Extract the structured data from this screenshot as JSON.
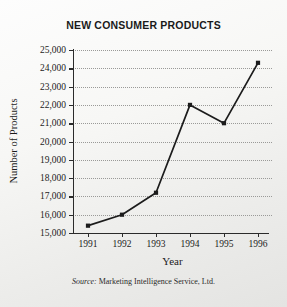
{
  "chart_data": {
    "type": "line",
    "title": "NEW CONSUMER PRODUCTS",
    "xlabel": "Year",
    "ylabel": "Number of Products",
    "categories": [
      "1991",
      "1992",
      "1993",
      "1994",
      "1995",
      "1996"
    ],
    "values": [
      15400,
      16000,
      17200,
      22000,
      21000,
      24300
    ],
    "ylim": [
      15000,
      25000
    ],
    "ytick_step": 1000,
    "ytick_labels": [
      "15,000",
      "16,000",
      "17,000",
      "18,000",
      "19,000",
      "20,000",
      "21,000",
      "22,000",
      "23,000",
      "24,000",
      "25,000"
    ],
    "ytick_values": [
      15000,
      16000,
      17000,
      18000,
      19000,
      20000,
      21000,
      22000,
      23000,
      24000,
      25000
    ],
    "grid": true,
    "grid_style": "dotted",
    "legend": false,
    "marker": "square",
    "line_color": "#1c1c1c",
    "marker_color": "#1c1c1c",
    "grid_color": "#9a9a98",
    "axis_color": "#2b2b2b",
    "background_color": "#f2f2f0"
  },
  "source": {
    "lead": "Source:",
    "text": " Marketing Intelligence Service, Ltd."
  }
}
